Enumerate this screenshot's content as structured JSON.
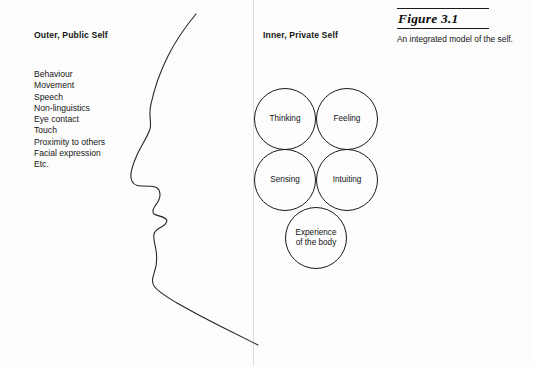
{
  "figure": {
    "number_label": "Figure 3.1",
    "description": "An integrated model of the self."
  },
  "left_panel": {
    "heading": "Outer, Public Self",
    "attributes": [
      "Behaviour",
      "Movement",
      "Speech",
      "Non-linguistics",
      "Eye contact",
      "Touch",
      "Proximity to others",
      "Facial expression",
      "Etc."
    ]
  },
  "right_panel": {
    "heading": "Inner, Private Self",
    "nodes": [
      {
        "id": "thinking",
        "label": "Thinking"
      },
      {
        "id": "feeling",
        "label": "Feeling"
      },
      {
        "id": "sensing",
        "label": "Sensing"
      },
      {
        "id": "intuiting",
        "label": "Intuiting"
      },
      {
        "id": "experience",
        "label": "Experience\nof the body"
      }
    ]
  },
  "colors": {
    "ink": "#1a1a1a",
    "page_background": "#fdfdfd",
    "divider": "#dcdcdc"
  }
}
